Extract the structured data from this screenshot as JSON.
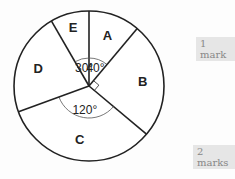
{
  "chart_data": {
    "type": "pie",
    "title": "",
    "start": "top",
    "direction": "clockwise",
    "slices": [
      {
        "label": "A",
        "angle_deg": 40,
        "angle_label": "40°"
      },
      {
        "label": "B",
        "angle_deg": 90,
        "angle_label": "",
        "right_angle_marker": true
      },
      {
        "label": "C",
        "angle_deg": 120,
        "angle_label": "120°"
      },
      {
        "label": "D",
        "angle_deg": 80,
        "angle_label": ""
      },
      {
        "label": "E",
        "angle_deg": 30,
        "angle_label": "30°"
      }
    ]
  },
  "marks": {
    "q1": "1 mark",
    "q2": "2 marks"
  },
  "colors": {
    "stroke": "#222222",
    "fill": "#ffffff",
    "mark_bg": "#e6e6e6",
    "mark_text": "#888888"
  }
}
